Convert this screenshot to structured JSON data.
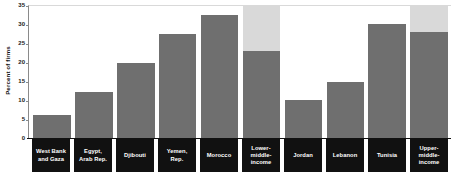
{
  "chart_data": {
    "type": "bar",
    "title": "",
    "xlabel": "",
    "ylabel": "Percent of firms",
    "ylim": [
      0,
      35
    ],
    "ytick_step": 5,
    "yticks": [
      "35",
      "30",
      "25",
      "20",
      "15",
      "10",
      "5",
      "0"
    ],
    "grid": false,
    "legend": "none",
    "categories": [
      "West Bank and Gaza",
      "Egypt, Arab Rep.",
      "Djibouti",
      "Yemen, Rep.",
      "Morocco",
      "Lower-middle-income",
      "Jordan",
      "Lebanon",
      "Tunisia",
      "Upper-middle-income"
    ],
    "category_lines": [
      [
        "West Bank",
        "and Gaza"
      ],
      [
        "Egypt,",
        "Arab Rep."
      ],
      [
        "Djibouti"
      ],
      [
        "Yemen,",
        "Rep."
      ],
      [
        "Morocco"
      ],
      [
        "Lower-",
        "middle-",
        "income"
      ],
      [
        "Jordan"
      ],
      [
        "Lebanon"
      ],
      [
        "Tunisia"
      ],
      [
        "Upper-",
        "middle-",
        "income"
      ]
    ],
    "series": [
      {
        "name": "Percent of firms",
        "values": [
          6.1,
          12.0,
          19.8,
          27.5,
          32.3,
          23.0,
          10.0,
          14.7,
          30.0,
          27.8
        ]
      }
    ],
    "background_series": {
      "name": "Reference band",
      "values": [
        null,
        null,
        null,
        null,
        null,
        35.0,
        null,
        null,
        null,
        35.0
      ]
    },
    "colors": {
      "bar": "#6f6f6f",
      "bar_background": "#d9d9d9",
      "label_band": "#111111",
      "label_text": "#ffffff",
      "axis": "#111111",
      "plot_background": "#ffffff"
    }
  }
}
